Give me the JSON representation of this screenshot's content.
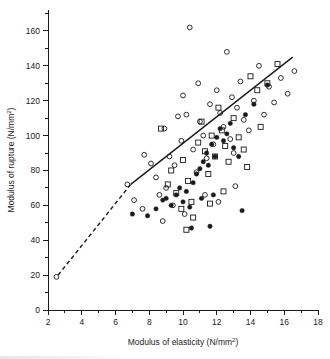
{
  "chart_data": {
    "type": "scatter",
    "title": "",
    "xlabel": "Modulus of elasticity (N/mm²)",
    "ylabel": "Modulus of rupture (N/mm²)",
    "xlim": [
      2,
      18
    ],
    "ylim": [
      0,
      172
    ],
    "xticks": [
      2,
      4,
      6,
      8,
      10,
      12,
      14,
      16,
      18
    ],
    "xtick_labels": [
      "2",
      "4",
      "6",
      "8",
      "10",
      "12",
      "14",
      "16",
      "18"
    ],
    "xminor_step": 1,
    "yticks": [
      0,
      20,
      40,
      60,
      80,
      100,
      120,
      140,
      160
    ],
    "ytick_labels": [
      "0",
      "20",
      "40",
      "60",
      "80",
      "100",
      "120",
      "140",
      "160"
    ],
    "yminor_step": 10,
    "grid": false,
    "legend_position": "none",
    "series": [
      {
        "name": "open-circle",
        "marker": "open-circle",
        "points": [
          [
            2.5,
            19
          ],
          [
            6.7,
            72
          ],
          [
            7.7,
            89
          ],
          [
            8.1,
            84
          ],
          [
            8.9,
            104
          ],
          [
            9.2,
            88
          ],
          [
            9.5,
            83
          ],
          [
            7.1,
            63
          ],
          [
            7.6,
            58
          ],
          [
            8.4,
            76
          ],
          [
            8.6,
            66
          ],
          [
            9.0,
            70
          ],
          [
            9.4,
            60
          ],
          [
            9.9,
            97
          ],
          [
            10.0,
            123
          ],
          [
            10.2,
            112
          ],
          [
            10.4,
            162
          ],
          [
            10.6,
            92
          ],
          [
            10.8,
            79
          ],
          [
            11.0,
            108
          ],
          [
            11.2,
            100
          ],
          [
            11.4,
            87
          ],
          [
            11.6,
            118
          ],
          [
            11.8,
            95
          ],
          [
            12.0,
            126
          ],
          [
            12.2,
            113
          ],
          [
            12.4,
            105
          ],
          [
            12.6,
            148
          ],
          [
            12.8,
            98
          ],
          [
            13.0,
            90
          ],
          [
            13.2,
            116
          ],
          [
            13.4,
            131
          ],
          [
            13.6,
            109
          ],
          [
            13.9,
            103
          ],
          [
            14.2,
            120
          ],
          [
            14.5,
            140
          ],
          [
            14.8,
            112
          ],
          [
            15.1,
            128
          ],
          [
            15.4,
            119
          ],
          [
            15.8,
            133
          ],
          [
            16.2,
            124
          ],
          [
            16.6,
            137
          ],
          [
            9.7,
            111
          ],
          [
            10.9,
            130
          ],
          [
            12.9,
            122
          ],
          [
            11.3,
            66
          ],
          [
            12.1,
            62
          ],
          [
            13.1,
            71
          ],
          [
            10.1,
            55
          ],
          [
            8.8,
            51
          ]
        ]
      },
      {
        "name": "open-square",
        "marker": "open-square",
        "points": [
          [
            8.7,
            104
          ],
          [
            9.3,
            80
          ],
          [
            9.6,
            67
          ],
          [
            10.0,
            86
          ],
          [
            10.3,
            74
          ],
          [
            10.5,
            62
          ],
          [
            10.9,
            96
          ],
          [
            11.1,
            108
          ],
          [
            11.3,
            91
          ],
          [
            11.5,
            78
          ],
          [
            11.7,
            100
          ],
          [
            11.9,
            88
          ],
          [
            12.1,
            116
          ],
          [
            12.3,
            103
          ],
          [
            12.5,
            94
          ],
          [
            12.7,
            85
          ],
          [
            13.0,
            110
          ],
          [
            13.3,
            99
          ],
          [
            13.6,
            92
          ],
          [
            14.0,
            134
          ],
          [
            14.4,
            126
          ],
          [
            15.0,
            130
          ],
          [
            15.6,
            141
          ],
          [
            9.9,
            58
          ],
          [
            10.6,
            53
          ],
          [
            11.6,
            61
          ],
          [
            12.4,
            68
          ],
          [
            10.2,
            46
          ],
          [
            13.8,
            82
          ],
          [
            14.6,
            105
          ],
          [
            9.1,
            72
          ]
        ]
      },
      {
        "name": "filled-circle",
        "marker": "filled-circle",
        "points": [
          [
            7.0,
            55
          ],
          [
            7.9,
            54
          ],
          [
            8.4,
            58
          ],
          [
            8.8,
            63
          ],
          [
            9.0,
            64
          ],
          [
            9.3,
            60
          ],
          [
            9.6,
            66
          ],
          [
            9.8,
            70
          ],
          [
            10.0,
            62
          ],
          [
            10.2,
            68
          ],
          [
            10.4,
            59
          ],
          [
            10.6,
            73
          ],
          [
            10.8,
            78
          ],
          [
            11.0,
            81
          ],
          [
            11.2,
            85
          ],
          [
            11.4,
            90
          ],
          [
            11.5,
            83
          ],
          [
            11.7,
            95
          ],
          [
            11.9,
            88
          ],
          [
            12.0,
            99
          ],
          [
            12.2,
            104
          ],
          [
            12.4,
            97
          ],
          [
            12.6,
            101
          ],
          [
            12.8,
            107
          ],
          [
            13.0,
            93
          ],
          [
            13.3,
            88
          ],
          [
            13.5,
            57
          ],
          [
            13.7,
            112
          ],
          [
            14.2,
            118
          ],
          [
            15.0,
            129
          ],
          [
            11.1,
            64
          ],
          [
            11.8,
            66
          ],
          [
            10.5,
            47
          ],
          [
            11.6,
            48
          ]
        ]
      }
    ],
    "trendline": {
      "name": "fitted-regression-line",
      "solid_from": [
        6.9,
        72
      ],
      "solid_to": [
        16.5,
        145
      ],
      "dashed_from": [
        2.6,
        20
      ],
      "dashed_to": [
        6.9,
        72
      ]
    }
  }
}
